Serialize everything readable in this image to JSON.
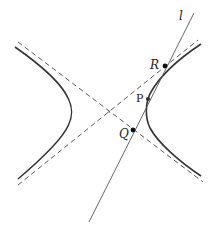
{
  "diagram": {
    "type": "hyperbola-with-secant-line",
    "labels": {
      "line": "l",
      "R": "R",
      "P": "P",
      "Q": "Q"
    },
    "colors": {
      "curve": "#333333",
      "asymptote": "#444444",
      "line": "#555555",
      "point": "#111111"
    }
  }
}
